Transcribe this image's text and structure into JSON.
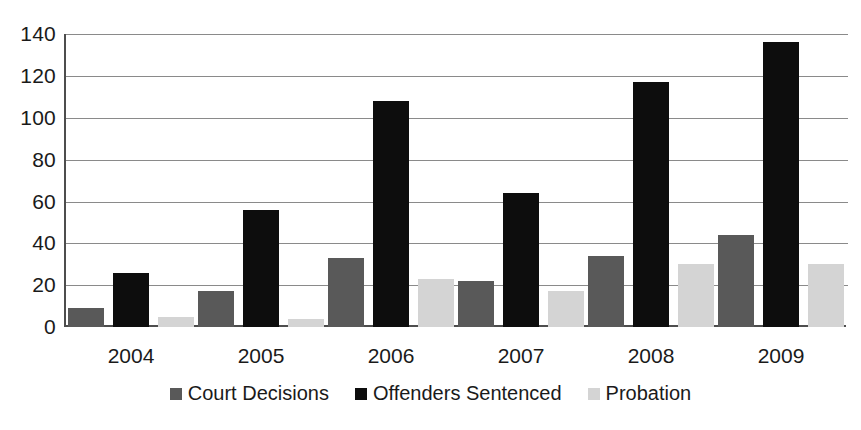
{
  "chart_data": {
    "type": "bar",
    "title": "",
    "subtitle": "",
    "xlabel": "",
    "ylabel": "",
    "categories": [
      "2004",
      "2005",
      "2006",
      "2007",
      "2008",
      "2009"
    ],
    "series": [
      {
        "name": "Court Decisions",
        "color": "#595959",
        "values": [
          9,
          17,
          33,
          22,
          34,
          44
        ]
      },
      {
        "name": "Offenders Sentenced",
        "color": "#0d0d0d",
        "values": [
          26,
          56,
          108,
          64,
          117,
          136
        ]
      },
      {
        "name": "Probation",
        "color": "#d4d4d4",
        "values": [
          5,
          4,
          23,
          17,
          30,
          30
        ]
      }
    ],
    "ylim": [
      0,
      140
    ],
    "yticks": [
      0,
      20,
      40,
      60,
      80,
      100,
      120,
      140
    ],
    "ytick_labels": [
      "0",
      "20",
      "40",
      "60",
      "80",
      "100",
      "120",
      "140"
    ],
    "grid": true,
    "grid_axis": "y",
    "legend_position": "bottom",
    "legend_entries": [
      "Court Decisions",
      "Offenders Sentenced",
      "Probation"
    ],
    "bar_mode": "grouped",
    "background_color": "#ffffff",
    "axis_color": "#4d4d4d",
    "gridline_color": "#8a8a8a"
  }
}
